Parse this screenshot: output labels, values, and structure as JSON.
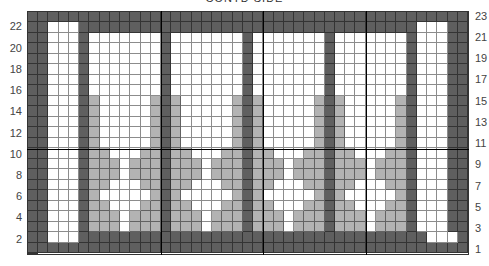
{
  "title": "CONTD SIDE",
  "chart_data": {
    "type": "heatmap",
    "title": "CONTD SIDE",
    "columns": 43,
    "rows": 23,
    "row_numbering": "bottom-to-top",
    "left_labels": [
      "22",
      "20",
      "18",
      "16",
      "14",
      "12",
      "10",
      "8",
      "6",
      "4",
      "2"
    ],
    "right_labels": [
      "23",
      "21",
      "19",
      "17",
      "15",
      "13",
      "11",
      "9",
      "7",
      "5",
      "3",
      "1"
    ],
    "legend": {
      "d": "dark (#5f5f5f)",
      "g": "gray (#b3b3b3)",
      "w": "white (#ffffff)"
    },
    "colors": {
      "d": "#5f5f5f",
      "g": "#b3b3b3",
      "w": "#ffffff"
    },
    "grid_rows_top_to_bottom": [
      "ddddddddddddddddddddddddddddddddddddddddddd",
      "ddwwwdddddddddddddddddddddddddddddddddwwwdd",
      "ddwwwdwwwwwwwdwwwwwwwdwwwwwwwdwwwwwwwdwwwdd",
      "ddwwwdwwwwwwwdwwwwwwwdwwwwwwwdwwwwwwwdwwwdd",
      "ddwwwdwwwwwwwdwwwwwwwdwwwwwwwdwwwwwwwdwwwdd",
      "ddwwwdwwwwwwwdwwwwwwwdwwwwwwwdwwwwwwwdwwwdd",
      "ddwwwdwwwwwwwdwwwwwwwdwwwwwwwdwwwwwwwdwwwdd",
      "ddwwwdwwwwwwwdwwwwwwwdwwwwwwwdwwwwwwwdwwwdd",
      "ddwwwdgwwwwwgdgwwwwwgdgwwwwwgdgwwwwwgdwwwdd",
      "ddwwwdgwwwwwgdgwwwwwgdgwwwwwgdgwwwwwgdwwwdd",
      "ddwwwdgwwwwwgdgwwwwwgdgwwwwwgdgwwwwwgdwwwdd",
      "ddwwwdgwwwwwgdgwwwwwgdgwwwwwgdgwwwwwgdwwwdd",
      "ddwwwdgwwwwwgdgwwwwwgdgwwwwwgdgwwwwwgdwwwdd",
      "ddwwwdggwwwggdggwwwggdggwwwggdggwwwggdwwwdd",
      "ddwwwdgggwgggdgggwgggdgggwgggdgggwgggdwwwdd",
      "ddwwwdgggwgggdgggwgggdgggwgggdgggwgggdwwwdd",
      "ddwwwdggwwwggdggwwwggdggwwwggdggwwwggdwwwdd",
      "ddwwwdgwwwwwgdgwwwwwgdgwwwwwgdgwwwwwgdwwwdd",
      "ddwwwdggwwwggdggwwwggdggwwwggdggwwwggdwwwdd",
      "ddwwwdgggwgggdgggwgggdgggwgggdgggwgggdwwwdd",
      "ddwwwdgggwgggdgggwgggdgggwgggdgggwgggdwwwdd",
      "ddwwwddddddddddddddddddddddddddddddddddwwwdd",
      "ddddddddddddddddddddddddddddddddddddddddddd"
    ],
    "ten_stitch_markers": {
      "horizontal_after_row": 10,
      "vertical_after_columns": [
        13,
        23,
        33
      ]
    },
    "grid": true
  }
}
